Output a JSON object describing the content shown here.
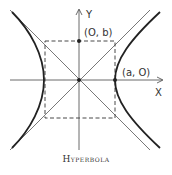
{
  "diagram": {
    "caption": "Hyperbola",
    "axes": {
      "x_label": "X",
      "y_label": "Y"
    },
    "points": [
      {
        "label": "(O, b)",
        "role": "co-vertex"
      },
      {
        "label": "(a, O)",
        "role": "vertex"
      }
    ],
    "colors": {
      "stroke": "#333333",
      "background": "#ffffff"
    }
  }
}
